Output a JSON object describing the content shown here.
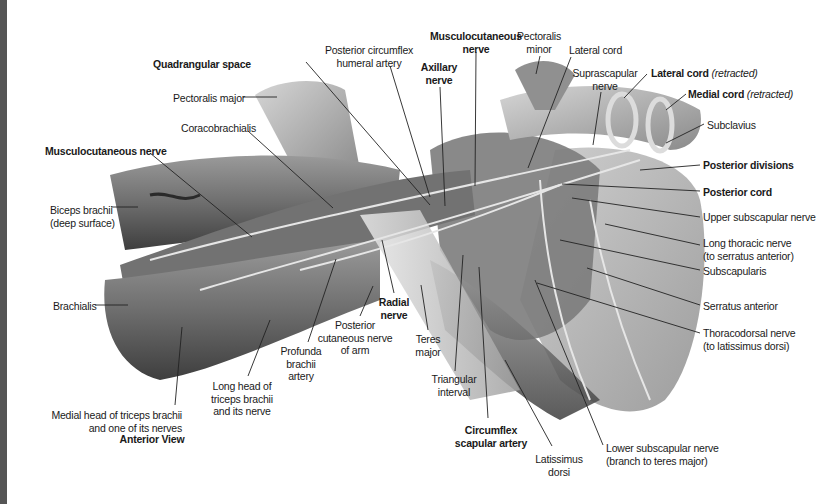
{
  "figure": {
    "view_caption": "Anterior View",
    "colors": {
      "background": "#ffffff",
      "left_bar": "#555555",
      "text": "#1a1a1a",
      "leader": "#222222"
    }
  },
  "labels": [
    {
      "id": "quadrangular-space",
      "text": "Quadrangular space",
      "bold": true,
      "x": 153,
      "y": 58,
      "align": "left",
      "line": [
        [
          306,
          62
        ],
        [
          430,
          205
        ]
      ]
    },
    {
      "id": "pectoralis-major",
      "text": "Pectoralis major",
      "bold": false,
      "x": 173,
      "y": 92,
      "align": "left",
      "line": [
        [
          243,
          97
        ],
        [
          277,
          97
        ]
      ]
    },
    {
      "id": "coracobrachialis",
      "text": "Coracobrachialis",
      "bold": false,
      "x": 181,
      "y": 122,
      "align": "left",
      "line": [
        [
          248,
          131
        ],
        [
          333,
          208
        ]
      ]
    },
    {
      "id": "musculocutaneous-nerve-left",
      "text": "Musculocutaneous nerve",
      "bold": true,
      "x": 45,
      "y": 145,
      "align": "left",
      "line": [
        [
          150,
          153
        ],
        [
          252,
          237
        ]
      ]
    },
    {
      "id": "biceps-brachii",
      "text": "Biceps brachii",
      "sub": "(deep surface)",
      "bold": false,
      "x": 50,
      "y": 204,
      "align": "left",
      "line": [
        [
          111,
          207
        ],
        [
          138,
          207
        ]
      ]
    },
    {
      "id": "brachialis",
      "text": "Brachialis",
      "bold": false,
      "x": 53,
      "y": 300,
      "align": "left",
      "line": [
        [
          95,
          305
        ],
        [
          128,
          305
        ]
      ]
    },
    {
      "id": "medial-head-triceps",
      "text": "Medial head of triceps brachii",
      "sub": "and one of its nerves",
      "bold": false,
      "x": 182,
      "y": 409,
      "align": "right",
      "line": [
        [
          175,
          405
        ],
        [
          182,
          327
        ]
      ]
    },
    {
      "id": "long-head-triceps",
      "text": "Long head of",
      "sub": "triceps brachii",
      "sub2": "and its nerve",
      "bold": false,
      "x": 242,
      "y": 380,
      "align": "center",
      "line": [
        [
          248,
          376
        ],
        [
          270,
          320
        ]
      ]
    },
    {
      "id": "profunda-brachii",
      "text": "Profunda",
      "sub": "brachii",
      "sub2": "artery",
      "bold": false,
      "x": 301,
      "y": 345,
      "align": "center",
      "line": [
        [
          308,
          342
        ],
        [
          336,
          259
        ]
      ]
    },
    {
      "id": "posterior-cutaneous-nerve",
      "text": "Posterior",
      "sub": "cutaneous nerve",
      "sub2": "of arm",
      "bold": false,
      "x": 355,
      "y": 319,
      "align": "center",
      "line": [
        [
          360,
          316
        ],
        [
          373,
          286
        ]
      ]
    },
    {
      "id": "radial-nerve",
      "text": "Radial",
      "sub": "nerve",
      "bold": true,
      "x": 394,
      "y": 296,
      "align": "center",
      "line": [
        [
          394,
          293
        ],
        [
          382,
          240
        ]
      ]
    },
    {
      "id": "teres-major",
      "text": "Teres",
      "sub": "major",
      "bold": false,
      "x": 428,
      "y": 333,
      "align": "center",
      "line": [
        [
          428,
          330
        ],
        [
          421,
          285
        ]
      ]
    },
    {
      "id": "triangular-interval",
      "text": "Triangular",
      "sub": "interval",
      "bold": false,
      "x": 454,
      "y": 373,
      "align": "center",
      "line": [
        [
          455,
          371
        ],
        [
          463,
          255
        ]
      ]
    },
    {
      "id": "circumflex-scapular-artery",
      "text": "Circumflex",
      "sub": "scapular artery",
      "bold": true,
      "x": 491,
      "y": 424,
      "align": "center",
      "line": [
        [
          488,
          418
        ],
        [
          479,
          267
        ]
      ]
    },
    {
      "id": "latissimus-dorsi",
      "text": "Latissimus",
      "sub": "dorsi",
      "bold": false,
      "x": 559,
      "y": 453,
      "align": "center",
      "line": [
        [
          552,
          446
        ],
        [
          505,
          360
        ]
      ]
    },
    {
      "id": "lower-subscapular-nerve",
      "text": "Lower subscapular nerve",
      "sub": "(branch to teres major)",
      "bold": false,
      "x": 606,
      "y": 442,
      "align": "left",
      "line": [
        [
          603,
          445
        ],
        [
          535,
          280
        ]
      ]
    },
    {
      "id": "posterior-circumflex-humeral-artery",
      "text": "Posterior circumflex",
      "sub": "humeral artery",
      "bold": false,
      "x": 369,
      "y": 44,
      "align": "center",
      "line": [
        [
          390,
          66
        ],
        [
          430,
          197
        ]
      ]
    },
    {
      "id": "axillary-nerve",
      "text": "Axillary",
      "sub": "nerve",
      "bold": true,
      "x": 439,
      "y": 61,
      "align": "center",
      "line": [
        [
          440,
          87
        ],
        [
          445,
          206
        ]
      ]
    },
    {
      "id": "musculocutaneous-nerve-top",
      "text": "Musculocutaneous",
      "sub": "nerve",
      "bold": true,
      "x": 476,
      "y": 30,
      "align": "center",
      "line": [
        [
          476,
          52
        ],
        [
          475,
          186
        ]
      ]
    },
    {
      "id": "pectoralis-minor",
      "text": "Pectoralis",
      "sub": "minor",
      "bold": false,
      "x": 539,
      "y": 30,
      "align": "center",
      "line": [
        [
          540,
          56
        ],
        [
          536,
          74
        ]
      ]
    },
    {
      "id": "lateral-cord",
      "text": "Lateral cord",
      "bold": false,
      "x": 569,
      "y": 44,
      "align": "left",
      "line": [
        [
          571,
          57
        ],
        [
          528,
          168
        ]
      ]
    },
    {
      "id": "suprascapular-nerve",
      "text": "Suprascapular",
      "sub": "nerve",
      "bold": false,
      "x": 605,
      "y": 67,
      "align": "center",
      "line": [
        [
          601,
          92
        ],
        [
          593,
          145
        ]
      ]
    },
    {
      "id": "lateral-cord-retracted",
      "text": "Lateral cord",
      "italic": "(retracted)",
      "bold": true,
      "x": 651,
      "y": 67,
      "align": "left",
      "line": [
        [
          647,
          74
        ],
        [
          624,
          98
        ]
      ]
    },
    {
      "id": "medial-cord-retracted",
      "text": "Medial cord",
      "italic": "(retracted)",
      "bold": true,
      "x": 688,
      "y": 88,
      "align": "left",
      "line": [
        [
          686,
          94
        ],
        [
          666,
          110
        ]
      ]
    },
    {
      "id": "subclavius",
      "text": "Subclavius",
      "bold": false,
      "x": 707,
      "y": 119,
      "align": "left",
      "line": [
        [
          704,
          124
        ],
        [
          666,
          143
        ]
      ]
    },
    {
      "id": "posterior-divisions",
      "text": "Posterior divisions",
      "bold": true,
      "x": 703,
      "y": 159,
      "align": "left",
      "line": [
        [
          700,
          165
        ],
        [
          640,
          170
        ]
      ]
    },
    {
      "id": "posterior-cord",
      "text": "Posterior cord",
      "bold": true,
      "x": 703,
      "y": 186,
      "align": "left",
      "line": [
        [
          700,
          191
        ],
        [
          562,
          184
        ]
      ]
    },
    {
      "id": "upper-subscapular-nerve",
      "text": "Upper subscapular nerve",
      "bold": false,
      "x": 703,
      "y": 211,
      "align": "left",
      "line": [
        [
          700,
          217
        ],
        [
          572,
          198
        ]
      ]
    },
    {
      "id": "long-thoracic-nerve",
      "text": "Long thoracic nerve",
      "sub": "(to serratus anterior)",
      "bold": false,
      "x": 703,
      "y": 237,
      "align": "left",
      "line": [
        [
          700,
          245
        ],
        [
          605,
          224
        ]
      ]
    },
    {
      "id": "subscapularis",
      "text": "Subscapularis",
      "bold": false,
      "x": 703,
      "y": 265,
      "align": "left",
      "line": [
        [
          700,
          270
        ],
        [
          560,
          240
        ]
      ]
    },
    {
      "id": "serratus-anterior",
      "text": "Serratus anterior",
      "bold": false,
      "x": 703,
      "y": 300,
      "align": "left",
      "line": [
        [
          700,
          305
        ],
        [
          587,
          268
        ]
      ]
    },
    {
      "id": "thoracodorsal-nerve",
      "text": "Thoracodorsal nerve",
      "sub": "(to latissimus dorsi)",
      "bold": false,
      "x": 703,
      "y": 327,
      "align": "left",
      "line": [
        [
          700,
          333
        ],
        [
          537,
          283
        ]
      ]
    }
  ]
}
